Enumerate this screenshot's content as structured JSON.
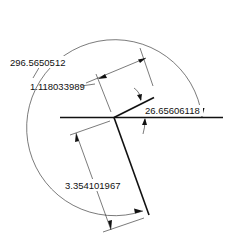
{
  "diagram": {
    "type": "cad-dimension-drawing",
    "dimensions": {
      "reflex_angle": "296.5650512",
      "short_length": "1.118033989",
      "acute_angle": "26.65606118",
      "long_length": "3.354101967"
    }
  }
}
